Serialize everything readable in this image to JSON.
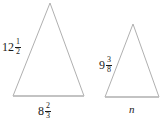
{
  "figure": {
    "type": "geometry-diagram",
    "background_color": "#ffffff",
    "stroke_color": "#b0b0b0",
    "text_color": "#1a1a1a",
    "shapes": [
      {
        "name": "left-triangle",
        "apex": {
          "x": 50,
          "y": 3
        },
        "base_left": {
          "x": 13,
          "y": 96
        },
        "base_right": {
          "x": 84,
          "y": 96
        },
        "labels": {
          "left_side": {
            "whole": "12",
            "numerator": "1",
            "denominator": "2"
          },
          "base": {
            "whole": "8",
            "numerator": "2",
            "denominator": "3"
          }
        }
      },
      {
        "name": "right-triangle",
        "apex": {
          "x": 133,
          "y": 24
        },
        "base_left": {
          "x": 105,
          "y": 97
        },
        "base_right": {
          "x": 159,
          "y": 97
        },
        "labels": {
          "left_side": {
            "whole": "9",
            "numerator": "3",
            "denominator": "8"
          },
          "base": {
            "variable": "n"
          }
        }
      }
    ]
  }
}
